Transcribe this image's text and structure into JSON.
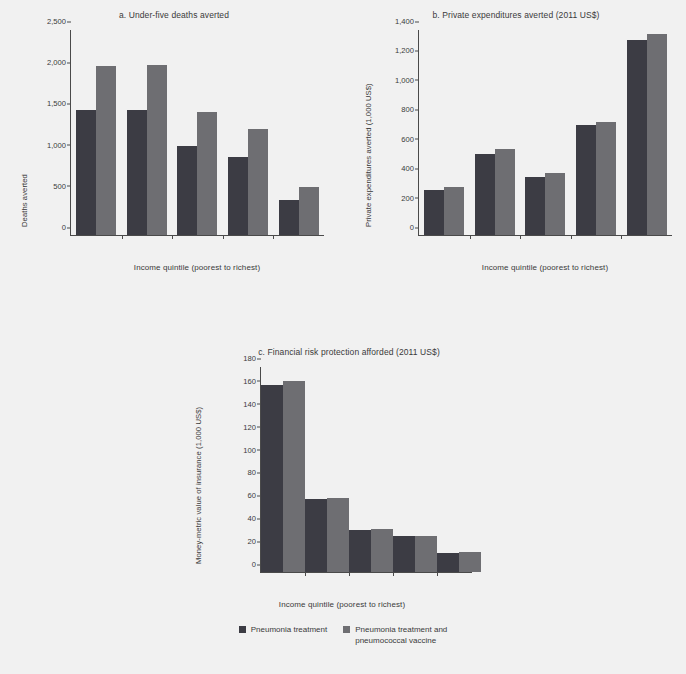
{
  "figure": {
    "background_color": "#f1f1f1",
    "series_colors": [
      "#3c3c44",
      "#6e6e72"
    ],
    "xlabel": "Income quintile (poorest to richest)"
  },
  "legend": {
    "position": "bottom-center",
    "items": [
      {
        "label": "Pneumonia treatment",
        "color": "#3c3c44"
      },
      {
        "label": "Pneumonia treatment and\npneumococcal vaccine",
        "color": "#6e6e72"
      }
    ]
  },
  "chart_data": [
    {
      "id": "a",
      "type": "bar",
      "title": "a. Under-five deaths averted",
      "xlabel": "Income quintile (poorest to richest)",
      "ylabel": "Deaths averted",
      "categories": [
        "1",
        "2",
        "3",
        "4",
        "5"
      ],
      "ylim": [
        0,
        2500
      ],
      "yticks": [
        0,
        500,
        1000,
        1500,
        2000,
        2500
      ],
      "ytick_labels": [
        "0",
        "500",
        "1,000",
        "1,500",
        "2,000",
        "2,500"
      ],
      "grid": false,
      "series": [
        {
          "name": "Pneumonia treatment",
          "values": [
            1520,
            1530,
            1090,
            950,
            430
          ]
        },
        {
          "name": "Pneumonia treatment and pneumococcal vaccine",
          "values": [
            2060,
            2070,
            1500,
            1295,
            585
          ]
        }
      ]
    },
    {
      "id": "b",
      "type": "bar",
      "title": "b. Private expenditures averted (2011 US$)",
      "xlabel": "Income quintile (poorest to richest)",
      "ylabel": "Private expenditures averted (1,000 US$)",
      "categories": [
        "1",
        "2",
        "3",
        "4",
        "5"
      ],
      "ylim": [
        0,
        1400
      ],
      "yticks": [
        0,
        200,
        400,
        600,
        800,
        1000,
        1200,
        1400
      ],
      "ytick_labels": [
        "0",
        "200",
        "400",
        "600",
        "800",
        "1,000",
        "1,200",
        "1,400"
      ],
      "grid": false,
      "series": [
        {
          "name": "Pneumonia treatment",
          "values": [
            305,
            555,
            395,
            750,
            1335
          ]
        },
        {
          "name": "Pneumonia treatment and pneumococcal vaccine",
          "values": [
            325,
            585,
            425,
            775,
            1370
          ]
        }
      ]
    },
    {
      "id": "c",
      "type": "bar",
      "title": "c. Financial risk protection afforded (2011 US$)",
      "xlabel": "Income quintile (poorest to richest)",
      "ylabel": "Money-metric value of insurance (1,000 US$)",
      "categories": [
        "1",
        "2",
        "3",
        "4",
        "5"
      ],
      "ylim": [
        0,
        180
      ],
      "yticks": [
        0,
        20,
        40,
        60,
        80,
        100,
        120,
        140,
        160,
        180
      ],
      "ytick_labels": [
        "0",
        "20",
        "40",
        "60",
        "80",
        "100",
        "120",
        "140",
        "160",
        "180"
      ],
      "grid": false,
      "series": [
        {
          "name": "Pneumonia treatment",
          "values": [
            164,
            64,
            37,
            31.5,
            17
          ]
        },
        {
          "name": "Pneumonia treatment and pneumococcal vaccine",
          "values": [
            167.5,
            65,
            38,
            32,
            17.5
          ]
        }
      ]
    }
  ]
}
